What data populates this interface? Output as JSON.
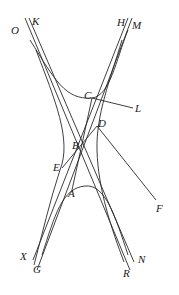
{
  "figure": {
    "type": "geometric-diagram",
    "labels": {
      "O": "O",
      "K": "K",
      "H": "H",
      "M": "M",
      "C": "C",
      "L": "L",
      "D": "D",
      "F": "F",
      "B": "B",
      "E": "E",
      "A": "A",
      "X": "X",
      "G": "G",
      "N": "N",
      "R": "R"
    },
    "colors": {
      "line": "#2a2a2a",
      "background": "#ffffff"
    }
  }
}
